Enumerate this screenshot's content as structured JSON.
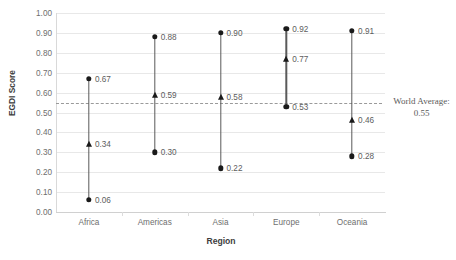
{
  "chart_data": {
    "type": "scatter",
    "title": "",
    "xlabel": "Region",
    "ylabel": "EGDI Score",
    "ylim": [
      0.0,
      1.0
    ],
    "grid": true,
    "legend": "none",
    "categories": [
      "Africa",
      "Americas",
      "Asia",
      "Europe",
      "Oceania"
    ],
    "ytick_labels": [
      "1.00",
      "0.90",
      "0.80",
      "0.70",
      "0.60",
      "0.50",
      "0.40",
      "0.30",
      "0.20",
      "0.10",
      "0.00"
    ],
    "ytick_values": [
      1.0,
      0.9,
      0.8,
      0.7,
      0.6,
      0.5,
      0.4,
      0.3,
      0.2,
      0.1,
      0.0
    ],
    "series": [
      {
        "name": "Maximum",
        "marker": "circle",
        "values": [
          0.67,
          0.88,
          0.9,
          0.92,
          0.91
        ],
        "labels": [
          "0.67",
          "0.88",
          "0.90",
          "0.92",
          "0.91"
        ]
      },
      {
        "name": "Average",
        "marker": "triangle",
        "values": [
          0.34,
          0.59,
          0.58,
          0.77,
          0.46
        ],
        "labels": [
          "0.34",
          "0.59",
          "0.58",
          "0.77",
          "0.46"
        ]
      },
      {
        "name": "Minimum",
        "marker": "circle",
        "values": [
          0.06,
          0.3,
          0.22,
          0.53,
          0.28
        ],
        "labels": [
          "0.06",
          "0.30",
          "0.22",
          "0.53",
          "0.28"
        ]
      }
    ],
    "reference_line": {
      "value": 0.55,
      "label_line1": "World Average:",
      "label_line2": "0.55",
      "style": "dashed",
      "color": "#9a9a9a"
    },
    "colors": {
      "marker": "#1a1a1a",
      "stem": "#5a5a5a",
      "grid": "#e8e8e8",
      "text": "#5d5d5d",
      "axis_title": "#3d3d3d"
    }
  }
}
